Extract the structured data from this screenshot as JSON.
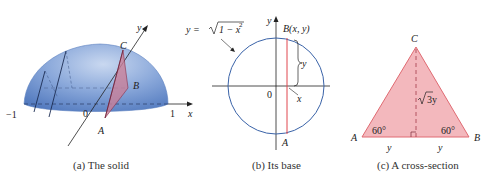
{
  "figure": {
    "panels": [
      {
        "id": "a",
        "caption": "(a) The solid",
        "labels": {
          "y_axis": "y",
          "x_axis": "x",
          "neg_one": "−1",
          "one": "1",
          "origin": "0",
          "A": "A",
          "B": "B",
          "C": "C"
        }
      },
      {
        "id": "b",
        "caption": "(b) Its base",
        "labels": {
          "equation_lhs": "y = ",
          "equation_radicand": "1 − x",
          "equation_exp": "2",
          "y_axis": "y",
          "point_B": "B(x, y)",
          "brace_label": "y",
          "x_label": "x",
          "origin": "0",
          "A": "A"
        }
      },
      {
        "id": "c",
        "caption": "(c) A cross-section",
        "labels": {
          "C": "C",
          "A": "A",
          "B": "B",
          "angle_left": "60°",
          "angle_right": "60°",
          "height": "3y",
          "base_left": "y",
          "base_right": "y"
        }
      }
    ],
    "colors": {
      "solid_fill": "#6f94cc",
      "solid_highlight": "#c3d4ee",
      "circle_stroke": "#3a63a8",
      "chord_stroke": "#e0474f",
      "triangle_fill": "#f3b8bd",
      "triangle_stroke": "#e06a72",
      "cross_section_fill": "#c98099"
    }
  }
}
